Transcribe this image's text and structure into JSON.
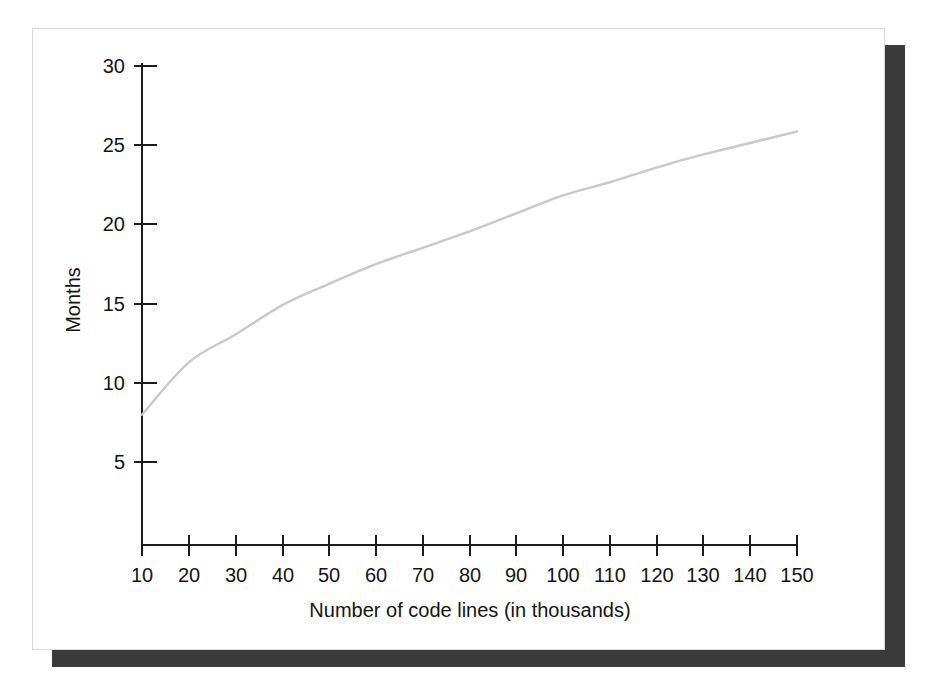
{
  "figure": {
    "card_background": "#ffffff",
    "card_border_color": "#d9d9d9",
    "shadow_color": "#3a3a3a",
    "page_background": "#ffffff"
  },
  "chart_data": {
    "type": "line",
    "title": "",
    "subtitle": "",
    "xlabel": "Number of code lines (in thousands)",
    "ylabel": "Months",
    "xlim": [
      10,
      150
    ],
    "ylim": [
      0.75,
      31
    ],
    "xticks": [
      10,
      20,
      30,
      40,
      50,
      60,
      70,
      80,
      90,
      100,
      110,
      120,
      130,
      140,
      150
    ],
    "xtick_labels": [
      "10",
      "20",
      "30",
      "40",
      "50",
      "60",
      "70",
      "80",
      "90",
      "100",
      "110",
      "120",
      "130",
      "140",
      "150"
    ],
    "yticks": [
      5,
      10,
      15,
      20,
      25,
      30
    ],
    "ytick_labels": [
      "5",
      "10",
      "15",
      "20",
      "25",
      "30"
    ],
    "grid": false,
    "legend": false,
    "legend_position": "none",
    "series": [
      {
        "name": "Development schedule",
        "color": "#c9c9c9",
        "line_width": 2.4,
        "x": [
          10,
          20,
          30,
          40,
          50,
          60,
          70,
          80,
          90,
          100,
          110,
          120,
          130,
          140,
          150
        ],
        "values": [
          8.7,
          11.9,
          13.6,
          15.4,
          16.7,
          17.9,
          18.9,
          19.9,
          21.0,
          22.1,
          22.9,
          23.8,
          24.6,
          25.3,
          26.0
        ]
      }
    ],
    "annotations": []
  },
  "axes": {
    "x_title": "Number of code lines (in thousands)",
    "y_title": "Months"
  }
}
